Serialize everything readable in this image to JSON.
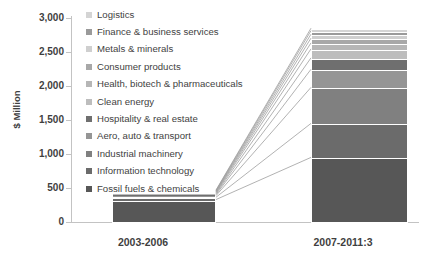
{
  "chart_data": {
    "type": "bar",
    "subtype": "stacked-bar-with-connectors",
    "title": "",
    "xlabel": "",
    "ylabel": "$ Million",
    "categories": [
      "2003-2006",
      "2007-2011:3"
    ],
    "ylim": [
      0,
      3000
    ],
    "yticks": [
      "0",
      "500",
      "1,000",
      "1,500",
      "2,000",
      "2,500",
      "3,000"
    ],
    "ytick_values": [
      0,
      500,
      1000,
      1500,
      2000,
      2500,
      3000
    ],
    "grid": false,
    "legend_position": "top-left-inside",
    "series": [
      {
        "name": "Logistics",
        "color": "#d4d4d4",
        "values": [
          6,
          36
        ]
      },
      {
        "name": "Finance & business services",
        "color": "#9a9a9a",
        "values": [
          8,
          52
        ]
      },
      {
        "name": "Metals & minerals",
        "color": "#cfcfcf",
        "values": [
          7,
          58
        ]
      },
      {
        "name": "Consumer products",
        "color": "#a8a8a8",
        "values": [
          9,
          70
        ]
      },
      {
        "name": "Health, biotech & pharmaceuticals",
        "color": "#b6b6b6",
        "values": [
          10,
          88
        ]
      },
      {
        "name": "Clean energy",
        "color": "#bdbdbd",
        "values": [
          12,
          132
        ]
      },
      {
        "name": "Hospitality & real estate",
        "color": "#6f6f6f",
        "values": [
          14,
          168
        ]
      },
      {
        "name": "Aero, auto & transport",
        "color": "#959595",
        "values": [
          16,
          266
        ]
      },
      {
        "name": "Industrial machinery",
        "color": "#808080",
        "values": [
          24,
          530
        ]
      },
      {
        "name": "Information technology",
        "color": "#6b6b6b",
        "values": [
          34,
          500
        ]
      },
      {
        "name": "Fossil fuels & chemicals",
        "color": "#575757",
        "values": [
          330,
          950
        ]
      }
    ],
    "totals": [
      470,
      2850
    ],
    "axis_color": "#c3c3c3",
    "text_color": "#3f3f3f",
    "background": "#ffffff",
    "connector_color": "#9e9e9e"
  }
}
